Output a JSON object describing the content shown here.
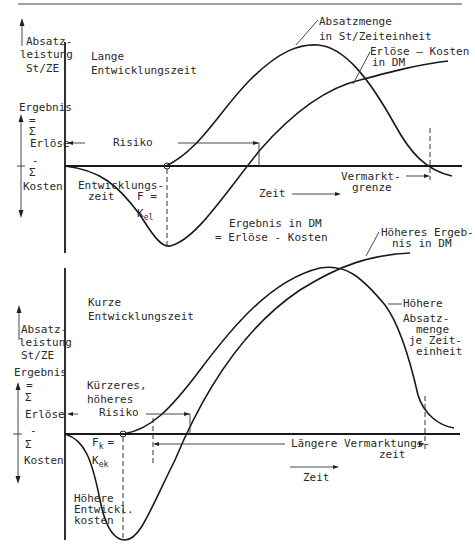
{
  "top_chart": {
    "y_axis_label_1": [
      "Absatz-",
      "leistung",
      "St/ZE"
    ],
    "y_axis_label_2": "Ergebnis",
    "y_axis_sum_label": [
      "=",
      "Σ",
      "Erlöse",
      "-",
      "Σ",
      "Kosten"
    ],
    "title": [
      "Lange",
      "Entwicklungszeit"
    ],
    "curve_label_absatz": [
      "Absatzmenge",
      "in St/Zeiteinheit"
    ],
    "curve_label_ergebnis": [
      "Erlöse — Kosten",
      "in DM"
    ],
    "risk_label": "Risiko",
    "dev_time_label": [
      "Entwicklungs-",
      "zeit"
    ],
    "f_label": "F =",
    "k_label": "K",
    "k_sub": "el",
    "time_label": "Zeit",
    "market_limit_label": [
      "Vermarkt-",
      "grenze"
    ],
    "result_label": [
      "Ergebnis in DM",
      "=   Erlöse -   Kosten"
    ]
  },
  "bottom_chart": {
    "y_axis_label_1": [
      "Absatz-",
      "leistung",
      "St/ZE"
    ],
    "y_axis_label_2": "Ergebnis",
    "y_axis_sum_label": [
      "=",
      "Σ",
      "Erlöse",
      "-",
      "Σ",
      "Kosten"
    ],
    "title": [
      "Kurze",
      "Entwicklungszeit"
    ],
    "curve_label_ergebnis": [
      "Höheres Ergeb-",
      "nis in DM"
    ],
    "curve_label_absatz": [
      "Höhere",
      "Absatz-",
      "menge",
      "je Zeit-",
      "einheit"
    ],
    "risk_label": [
      "Kürzeres,",
      "höheres",
      "Risiko"
    ],
    "f_label": "F",
    "f_sub": "k",
    "f_eq": "=",
    "k_label": "K",
    "k_sub": "ek",
    "cost_label": [
      "Höhere",
      "Entwickl.",
      "kosten"
    ],
    "market_time_label": [
      "Längere Vermarktungs-",
      "zeit"
    ],
    "time_label": "Zeit"
  }
}
